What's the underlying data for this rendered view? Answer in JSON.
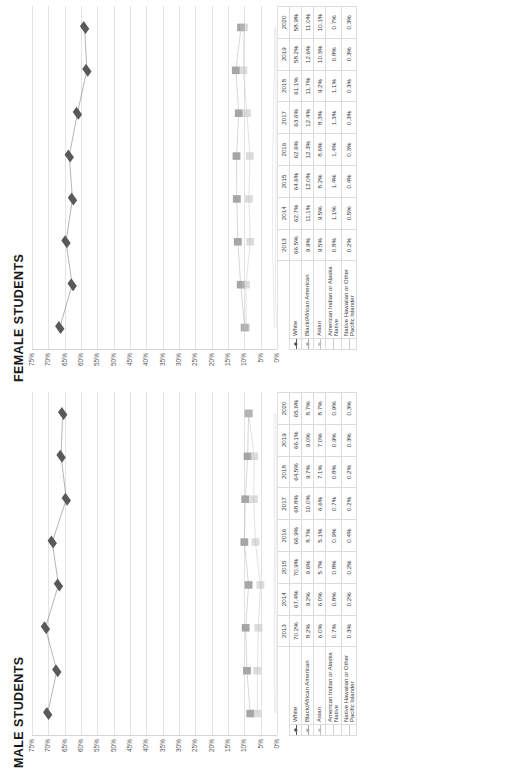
{
  "charts": [
    {
      "id": "female",
      "title": "FEMALE STUDENTS",
      "yticks": [
        "75%",
        "70%",
        "65%",
        "60%",
        "55%",
        "50%",
        "45%",
        "40%",
        "35%",
        "30%",
        "25%",
        "20%",
        "15%",
        "10%",
        "5%",
        "0%"
      ],
      "years": [
        "2013",
        "2014",
        "2015",
        "2016",
        "2017",
        "2018",
        "2019",
        "2020"
      ],
      "rows": [
        {
          "label": "White",
          "marker": "diamond",
          "color": "#595959",
          "values": [
            "66.5%",
            "62.7%",
            "64.6%",
            "62.6%",
            "63.6%",
            "61.1%",
            "58.2%",
            "58.9%"
          ]
        },
        {
          "label": "Black/African American",
          "marker": "square",
          "color": "#a6a6a6",
          "values": [
            "9.9%",
            "11.1%",
            "12.0%",
            "12.3%",
            "12.4%",
            "11.7%",
            "12.6%",
            "11.0%"
          ]
        },
        {
          "label": "Asian",
          "marker": "cross",
          "color": "#bfbfbf",
          "values": [
            "9.5%",
            "9.5%",
            "8.2%",
            "8.6%",
            "8.3%",
            "9.2%",
            "10.3%",
            "10.1%"
          ]
        },
        {
          "label": "American Indian or Alaska Native",
          "marker": "line",
          "color": "#d0d0d0",
          "values": [
            "0.8%",
            "1.1%",
            "1.4%",
            "1.4%",
            "1.3%",
            "1.1%",
            "0.8%",
            "0.7%"
          ]
        },
        {
          "label": "Native Hawaiian or Other Pacific Islander",
          "marker": "tick",
          "color": "#cccccc",
          "values": [
            "0.2%",
            "0.5%",
            "0.4%",
            "0.3%",
            "0.3%",
            "0.3%",
            "0.3%",
            "0.3%"
          ]
        }
      ]
    },
    {
      "id": "male",
      "title": "MALE STUDENTS",
      "yticks": [
        "75%",
        "70%",
        "65%",
        "60%",
        "55%",
        "50%",
        "45%",
        "40%",
        "35%",
        "30%",
        "25%",
        "20%",
        "15%",
        "10%",
        "5%",
        "0%"
      ],
      "years": [
        "2013",
        "2014",
        "2015",
        "2016",
        "2017",
        "2018",
        "2019",
        "2020"
      ],
      "rows": [
        {
          "label": "White",
          "marker": "diamond",
          "color": "#595959",
          "values": [
            "70.2%",
            "67.4%",
            "70.9%",
            "66.9%",
            "68.8%",
            "64.5%",
            "66.1%",
            "65.6%"
          ]
        },
        {
          "label": "Black/African American",
          "marker": "square",
          "color": "#a6a6a6",
          "values": [
            "8.2%",
            "9.2%",
            "9.6%",
            "8.7%",
            "10.0%",
            "9.7%",
            "9.0%",
            "8.7%"
          ]
        },
        {
          "label": "Asian",
          "marker": "cross",
          "color": "#bfbfbf",
          "values": [
            "6.0%",
            "6.0%",
            "5.7%",
            "5.1%",
            "6.6%",
            "7.1%",
            "7.0%",
            "8.7%"
          ]
        },
        {
          "label": "American Indian or Alaska Native",
          "marker": "line",
          "color": "#d0d0d0",
          "values": [
            "0.7%",
            "0.8%",
            "0.8%",
            "0.9%",
            "0.7%",
            "0.8%",
            "0.9%",
            "0.9%"
          ]
        },
        {
          "label": "Native Hawaiian or Other Pacific Islander",
          "marker": "tick",
          "color": "#cccccc",
          "values": [
            "0.3%",
            "0.2%",
            "0.2%",
            "0.4%",
            "0.2%",
            "0.2%",
            "0.3%",
            "0.3%"
          ]
        }
      ]
    }
  ],
  "chart_data": [
    {
      "type": "line",
      "title": "MALE STUDENTS",
      "xlabel": "",
      "ylabel": "",
      "ylim": [
        0,
        75
      ],
      "ytick_step": 5,
      "grid": true,
      "legend_position": "table-bottom",
      "categories": [
        "2013",
        "2014",
        "2015",
        "2016",
        "2017",
        "2018",
        "2019",
        "2020"
      ],
      "series": [
        {
          "name": "White",
          "values": [
            70.2,
            67.4,
            70.9,
            66.9,
            68.8,
            64.5,
            66.1,
            65.6
          ]
        },
        {
          "name": "Black/African American",
          "values": [
            8.2,
            9.2,
            9.6,
            8.7,
            10.0,
            9.7,
            9.0,
            8.7
          ]
        },
        {
          "name": "Asian",
          "values": [
            6.0,
            6.0,
            5.7,
            5.1,
            6.6,
            7.1,
            7.0,
            8.7
          ]
        },
        {
          "name": "American Indian or Alaska Native",
          "values": [
            0.7,
            0.8,
            0.8,
            0.9,
            0.7,
            0.8,
            0.9,
            0.9
          ]
        },
        {
          "name": "Native Hawaiian or Other Pacific Islander",
          "values": [
            0.3,
            0.2,
            0.2,
            0.4,
            0.2,
            0.2,
            0.3,
            0.3
          ]
        }
      ]
    },
    {
      "type": "line",
      "title": "FEMALE STUDENTS",
      "xlabel": "",
      "ylabel": "",
      "ylim": [
        0,
        75
      ],
      "ytick_step": 5,
      "grid": true,
      "legend_position": "table-bottom",
      "categories": [
        "2013",
        "2014",
        "2015",
        "2016",
        "2017",
        "2018",
        "2019",
        "2020"
      ],
      "series": [
        {
          "name": "White",
          "values": [
            66.5,
            62.7,
            64.6,
            62.6,
            63.6,
            61.1,
            58.2,
            58.9
          ]
        },
        {
          "name": "Black/African American",
          "values": [
            9.9,
            11.1,
            12.0,
            12.3,
            12.4,
            11.7,
            12.6,
            11.0
          ]
        },
        {
          "name": "Asian",
          "values": [
            9.5,
            9.5,
            8.2,
            8.6,
            8.3,
            9.2,
            10.3,
            10.1
          ]
        },
        {
          "name": "American Indian or Alaska Native",
          "values": [
            0.8,
            1.1,
            1.4,
            1.4,
            1.3,
            1.1,
            0.8,
            0.7
          ]
        },
        {
          "name": "Native Hawaiian or Other Pacific Islander",
          "values": [
            0.2,
            0.5,
            0.4,
            0.3,
            0.3,
            0.3,
            0.3,
            0.3
          ]
        }
      ]
    }
  ]
}
